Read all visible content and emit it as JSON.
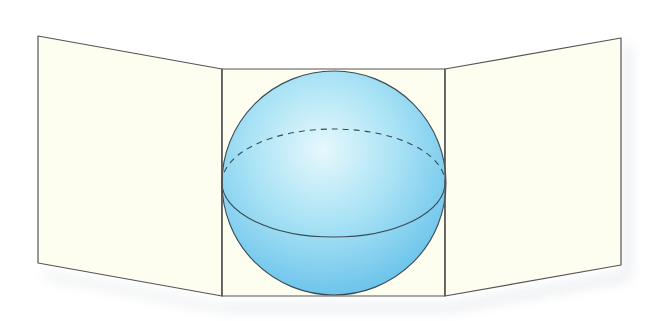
{
  "figure": {
    "colors": {
      "background": "#ffffff",
      "panel_fill": "#fdfdf0",
      "stroke": "#555555",
      "sphere_light": "#e6f8fd",
      "sphere_mid": "#a8e2f5",
      "sphere_dark": "#5bbbe8",
      "sphere_stroke": "#3b4a55",
      "shadow": "#d9dde2"
    },
    "panels": {
      "left": {
        "points": "38,36 222,69 222,296 38,263"
      },
      "center": {
        "points": "222,69 445,69 445,296 222,296"
      },
      "right": {
        "points": "445,69 621,38 621,265 445,296"
      }
    },
    "sphere": {
      "cx": 334,
      "cy": 183,
      "r": 112
    },
    "equator": {
      "back_dashed": "M222,183 A111.5,54 0 0,1 445,183",
      "front_solid": "M222,183 A111.5,54 0 0,0 445,183"
    }
  }
}
